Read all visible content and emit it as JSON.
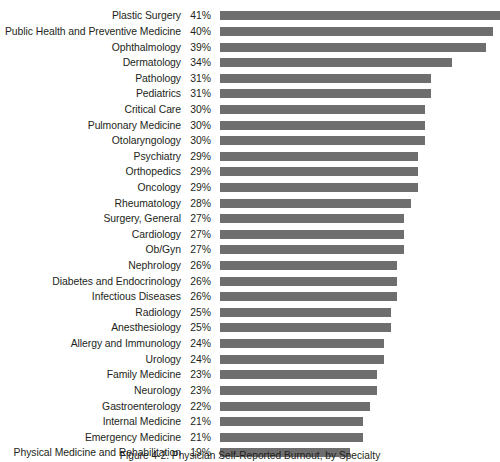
{
  "figure": {
    "caption": "Figure 4-2. Physician Self-Reported Burnout, by Specialty"
  },
  "chart_data": {
    "type": "bar",
    "orientation": "horizontal",
    "title": "",
    "xlabel": "",
    "ylabel": "",
    "grid": false,
    "legend": null,
    "value_suffix": "%",
    "xlim": [
      0,
      41
    ],
    "bar_color": "#6e6e6e",
    "categories": [
      "Plastic Surgery",
      "Public Health and Preventive Medicine",
      "Ophthalmology",
      "Dermatology",
      "Pathology",
      "Pediatrics",
      "Critical Care",
      "Pulmonary Medicine",
      "Otolaryngology",
      "Psychiatry",
      "Orthopedics",
      "Oncology",
      "Rheumatology",
      "Surgery, General",
      "Cardiology",
      "Ob/Gyn",
      "Nephrology",
      "Diabetes and Endocrinology",
      "Infectious Diseases",
      "Radiology",
      "Anesthesiology",
      "Allergy and Immunology",
      "Urology",
      "Family Medicine",
      "Neurology",
      "Gastroenterology",
      "Internal Medicine",
      "Emergency Medicine",
      "Physical Medicine and Rehabilitation"
    ],
    "values": [
      41,
      40,
      39,
      34,
      31,
      31,
      30,
      30,
      30,
      29,
      29,
      29,
      28,
      27,
      27,
      27,
      26,
      26,
      26,
      25,
      25,
      24,
      24,
      23,
      23,
      22,
      21,
      21,
      19
    ],
    "value_labels": [
      "41%",
      "40%",
      "39%",
      "34%",
      "31%",
      "31%",
      "30%",
      "30%",
      "30%",
      "29%",
      "29%",
      "29%",
      "28%",
      "27%",
      "27%",
      "27%",
      "26%",
      "26%",
      "26%",
      "25%",
      "25%",
      "24%",
      "24%",
      "23%",
      "23%",
      "22%",
      "21%",
      "21%",
      "19%"
    ]
  }
}
